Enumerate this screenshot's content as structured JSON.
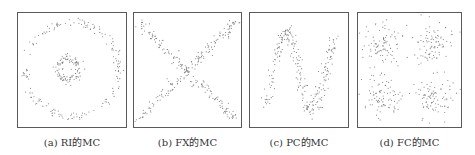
{
  "figure": {
    "panels": [
      {
        "id": "a",
        "caption": "(a)  RI的MC",
        "pattern": "ring-inside-ring",
        "box": {
          "left": 17,
          "width": 110
        }
      },
      {
        "id": "b",
        "caption": "(b)  FX的MC",
        "pattern": "x-cross",
        "box": {
          "left": 133,
          "width": 109
        }
      },
      {
        "id": "c",
        "caption": "(c)  PC的MC",
        "pattern": "sine-wave",
        "box": {
          "left": 249,
          "width": 100
        }
      },
      {
        "id": "d",
        "caption": "(d)  FC的MC",
        "pattern": "four-clusters",
        "box": {
          "left": 357,
          "width": 105
        }
      }
    ],
    "point_color": "#777777",
    "border_color": "#5a5a5a"
  }
}
